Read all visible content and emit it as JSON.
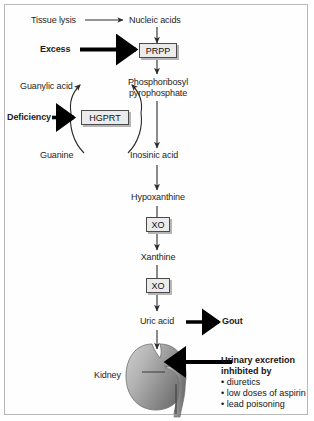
{
  "figure": {
    "border_color": "#b9b9b9",
    "background": "#ffffff"
  },
  "nodes": {
    "tissue_lysis": "Tissue lysis",
    "nucleic_acids": "Nucleic acids",
    "excess": "Excess",
    "prpp_box": "PRPP",
    "prpp_full_line1": "Phosphoribosyl",
    "prpp_full_line2": "pyrophosphate",
    "guanylic_acid": "Guanylic acid",
    "deficiency": "Deficiency",
    "hgprt_box": "HGPRT",
    "guanine": "Guanine",
    "inosinic_acid": "Inosinic acid",
    "hypoxanthine": "Hypoxanthine",
    "xo_box_1": "XO",
    "xanthine": "Xanthine",
    "xo_box_2": "XO",
    "uric_acid": "Uric acid",
    "gout": "Gout",
    "kidney": "Kidney"
  },
  "callout": {
    "heading_line1": "Urinary excretion",
    "heading_line2": "inhibited by",
    "items": [
      "diuretics",
      "low doses of aspirin",
      "lead poisoning"
    ]
  },
  "colors": {
    "text": "#1d1d1d",
    "arrow_thin": "#2b2b2b",
    "arrow_thick": "#000000",
    "box_fill": "#ebebeb",
    "box_stroke": "#4a4a4a",
    "kidney_light": "#d6d6d6",
    "kidney_mid": "#a8a8a8",
    "kidney_dark": "#7e7e7e"
  }
}
